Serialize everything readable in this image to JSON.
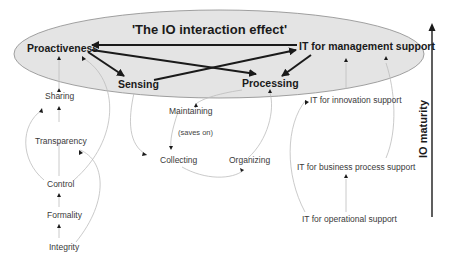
{
  "title": "'The IO interaction effect'",
  "axis": {
    "label": "IO maturity"
  },
  "core_nodes": {
    "proactiveness": "Proactiveness",
    "it_management": "IT for management support",
    "sensing": "Sensing",
    "processing": "Processing"
  },
  "left_chain": {
    "sharing": "Sharing",
    "transparency": "Transparency",
    "control": "Control",
    "formality": "Formality",
    "integrity": "Integrity"
  },
  "middle_cycle": {
    "maintaining": "Maintaining",
    "saves_on": "(saves on)",
    "collecting": "Collecting",
    "organizing": "Organizing"
  },
  "right_chain": {
    "it_innovation": "IT for innovation support",
    "it_business_process": "IT for business process support",
    "it_operational": "IT for operational support"
  },
  "colors": {
    "ellipse_fill": "#e4e4e4",
    "ellipse_stroke": "#8a8a8a",
    "strong_arrow": "#1a1a1a",
    "weak_arrow": "#b8b8b8"
  }
}
